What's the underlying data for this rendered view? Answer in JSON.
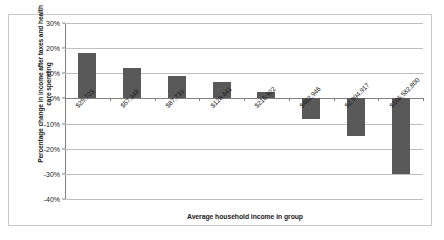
{
  "chart_data": {
    "type": "bar",
    "title": "",
    "xlabel": "Average household income in group",
    "ylabel": "Percentage change in income after taxes and health care spending",
    "categories": [
      "$25,723",
      "$57,348",
      "$87,733",
      "$128,441",
      "$216,922",
      "$462,946",
      "$2,994,917",
      "$166,582,800"
    ],
    "values": [
      18,
      12,
      9,
      6.5,
      2.5,
      -8,
      -15,
      -30
    ],
    "ylim": [
      -40,
      30
    ],
    "ytick_labels": [
      "30%",
      "20%",
      "10%",
      "0%",
      "-10%",
      "-20%",
      "-30%",
      "-40%"
    ],
    "ytick_values": [
      30,
      20,
      10,
      0,
      -10,
      -20,
      -30,
      -40
    ],
    "grid": true,
    "legend": "none",
    "bar_color": "#595959",
    "grid_color": "#bfbfbf",
    "axis_color": "#808080",
    "frame_color": "#c9c9c9",
    "background": "#ffffff"
  }
}
